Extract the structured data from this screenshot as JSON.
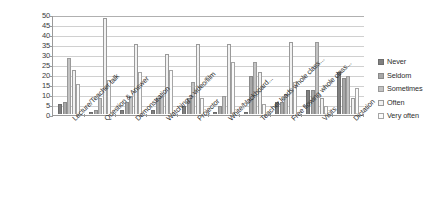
{
  "chart_data": {
    "type": "bar",
    "title": "",
    "xlabel": "",
    "ylabel": "",
    "ylim": [
      0,
      50
    ],
    "ytick_step": 5,
    "yticks": [
      0,
      5,
      10,
      15,
      20,
      25,
      30,
      35,
      40,
      45,
      50
    ],
    "grid": true,
    "legend_position": "right",
    "orientation": "vertical",
    "grouping": "clustered",
    "categories": [
      "Lecture/Teacher talk",
      "Question & Answer",
      "Demonstration",
      "Watching a video/film",
      "Projector",
      "White/blackboard...",
      "Teacher leads whole class...",
      "Free flowing whole class...",
      "Visits",
      "Dictation"
    ],
    "series": [
      {
        "name": "Never",
        "color": "#808080",
        "values": [
          5,
          1,
          2,
          2,
          4,
          1,
          1,
          6,
          12,
          21
        ]
      },
      {
        "name": "Seldom",
        "color": "#a8a8a8",
        "values": [
          6,
          2,
          6,
          8,
          8,
          4,
          19,
          6,
          12,
          18
        ]
      },
      {
        "name": "Sometimes",
        "color": "#c3c3c3",
        "values": [
          28,
          8,
          9,
          9,
          16,
          9,
          26,
          10,
          36,
          19
        ]
      },
      {
        "name": "Often",
        "color": "#f2f2f2",
        "values": [
          22,
          48,
          35,
          30,
          35,
          35,
          21,
          36,
          8,
          8
        ]
      },
      {
        "name": "Very often",
        "color": "#fbfbfb",
        "values": [
          15,
          17,
          21,
          22,
          8,
          26,
          5,
          16,
          4,
          13
        ]
      }
    ]
  },
  "legend": {
    "items": [
      {
        "label": "Never"
      },
      {
        "label": "Seldom"
      },
      {
        "label": "Sometimes"
      },
      {
        "label": "Often"
      },
      {
        "label": "Very often"
      }
    ]
  }
}
